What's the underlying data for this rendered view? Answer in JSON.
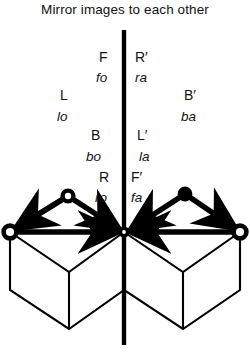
{
  "figure": {
    "title": "Mirror images to each other",
    "type": "mirror-symmetry-diagram",
    "mirror_line": {
      "orientation": "vertical",
      "x": 124,
      "y_top": 30,
      "y_bottom": 345,
      "color": "#000000"
    }
  },
  "labels": {
    "left": [
      {
        "name": "label-F",
        "text": "F",
        "style": "upright",
        "x": 99,
        "y": 50
      },
      {
        "name": "label-fo",
        "text": "fo",
        "style": "italic",
        "x": 96,
        "y": 71
      },
      {
        "name": "label-L",
        "text": "L",
        "style": "upright",
        "x": 60,
        "y": 88
      },
      {
        "name": "label-lo",
        "text": "lo",
        "style": "italic",
        "x": 57,
        "y": 110
      },
      {
        "name": "label-B",
        "text": "B",
        "style": "upright",
        "x": 91,
        "y": 128
      },
      {
        "name": "label-bo",
        "text": "bo",
        "style": "italic",
        "x": 86,
        "y": 150
      },
      {
        "name": "label-R",
        "text": "R",
        "style": "upright",
        "x": 99,
        "y": 170
      },
      {
        "name": "label-ro",
        "text": "ro",
        "style": "italic",
        "x": 95,
        "y": 191
      }
    ],
    "right": [
      {
        "name": "label-R-prime",
        "text": "R′",
        "style": "upright",
        "x": 135,
        "y": 50
      },
      {
        "name": "label-ra",
        "text": "ra",
        "style": "italic",
        "x": 135,
        "y": 71
      },
      {
        "name": "label-B-prime",
        "text": "B′",
        "style": "upright",
        "x": 184,
        "y": 88
      },
      {
        "name": "label-ba",
        "text": "ba",
        "style": "italic",
        "x": 181,
        "y": 110
      },
      {
        "name": "label-L-prime",
        "text": "L′",
        "style": "upright",
        "x": 137,
        "y": 128
      },
      {
        "name": "label-la",
        "text": "la",
        "style": "italic",
        "x": 139,
        "y": 150
      },
      {
        "name": "label-F-prime",
        "text": "F′",
        "style": "upright",
        "x": 131,
        "y": 170
      },
      {
        "name": "label-fa",
        "text": "fa",
        "style": "italic",
        "x": 131,
        "y": 191
      }
    ]
  },
  "geometry": {
    "nodes": [
      {
        "name": "node-origin",
        "x": 124,
        "y": 232,
        "fill": "solid"
      },
      {
        "name": "node-left-outer",
        "x": 10,
        "y": 232,
        "fill": "ring"
      },
      {
        "name": "node-left-upper",
        "x": 68,
        "y": 196,
        "fill": "ring"
      },
      {
        "name": "node-right-upper",
        "x": 185,
        "y": 194,
        "fill": "solid"
      },
      {
        "name": "node-right-outer",
        "x": 240,
        "y": 232,
        "fill": "ring"
      }
    ],
    "vectors": [
      {
        "name": "vector-left-horizontal",
        "from": [
          10,
          232
        ],
        "to": [
          124,
          232
        ]
      },
      {
        "name": "vector-left-diagonal",
        "from": [
          68,
          196
        ],
        "to": [
          124,
          232
        ]
      },
      {
        "name": "vector-left-outward",
        "from": [
          68,
          196
        ],
        "to": [
          10,
          232
        ]
      },
      {
        "name": "vector-right-horizontal",
        "from": [
          240,
          232
        ],
        "to": [
          124,
          232
        ]
      },
      {
        "name": "vector-right-diagonal",
        "from": [
          185,
          194
        ],
        "to": [
          124,
          232
        ]
      },
      {
        "name": "vector-right-outward",
        "from": [
          185,
          194
        ],
        "to": [
          240,
          232
        ]
      }
    ],
    "cubes": [
      {
        "name": "cube-left",
        "top_left": [
          10,
          232
        ],
        "top_right": [
          124,
          232
        ],
        "front_vertex": [
          69,
          272
        ]
      },
      {
        "name": "cube-right",
        "top_left": [
          124,
          232
        ],
        "top_right": [
          240,
          232
        ],
        "front_vertex": [
          183,
          272
        ]
      }
    ]
  }
}
